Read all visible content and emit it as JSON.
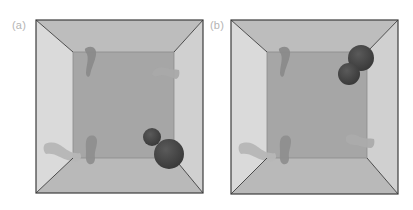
{
  "figure": {
    "panels": [
      {
        "id": "a",
        "label": "(a)",
        "label_pos": [
          12,
          19
        ],
        "outer": {
          "x1": 36,
          "y1": 20,
          "x2": 203,
          "y2": 193
        },
        "inner": {
          "x1": 73,
          "y1": 52,
          "x2": 174,
          "y2": 158
        },
        "spheres": [
          {
            "cx": 152,
            "cy": 137,
            "r": 9
          },
          {
            "cx": 169,
            "cy": 154,
            "r": 15
          }
        ],
        "worms": [
          {
            "name": "worm-top-left",
            "d": "M86,48 C92,45 97,48 96,55 C95,62 91,68 90,75 C89,78 86,77 86,73 C86,66 89,60 87,54 C85,51 84,49 86,48 Z",
            "fill": "#8a8a8a"
          },
          {
            "name": "worm-top-right",
            "d": "M152,74 C154,68 160,66 166,68 C171,70 175,69 179,70 C180,74 179,78 176,79 C171,78 166,75 161,75 C157,76 154,78 152,74 Z",
            "fill": "#a9a9a9"
          },
          {
            "name": "worm-left-wall",
            "d": "M45,144 C52,141 58,143 63,147 C68,151 74,154 80,153 C82,156 81,160 78,161 C72,162 66,160 60,157 C55,154 50,153 46,154 C43,151 43,146 45,144 Z",
            "fill": "#b6b6b6"
          },
          {
            "name": "worm-bottom-center",
            "d": "M88,137 C92,134 97,136 97,141 C97,147 94,152 95,158 C95,162 93,165 89,164 C85,162 86,156 86,151 C86,146 85,140 88,137 Z",
            "fill": "#8e8e8e"
          }
        ]
      },
      {
        "id": "b",
        "label": "(b)",
        "label_pos": [
          210,
          19
        ],
        "outer": {
          "x1": 231,
          "y1": 20,
          "x2": 398,
          "y2": 194
        },
        "inner": {
          "x1": 267,
          "y1": 52,
          "x2": 367,
          "y2": 158
        },
        "spheres": [
          {
            "cx": 361,
            "cy": 58,
            "r": 13
          },
          {
            "cx": 349,
            "cy": 74,
            "r": 11
          }
        ],
        "worms": [
          {
            "name": "worm-top-left",
            "d": "M280,48 C286,45 291,48 290,55 C289,62 285,68 284,75 C283,78 280,77 280,73 C280,66 283,60 281,54 C279,51 278,49 280,48 Z",
            "fill": "#8a8a8a"
          },
          {
            "name": "worm-bottom-right",
            "d": "M346,137 C349,133 355,134 360,137 C365,139 370,138 374,139 C375,143 374,147 371,148 C366,148 361,146 356,145 C351,145 348,144 346,141 Z",
            "fill": "#ababab"
          },
          {
            "name": "worm-left-wall",
            "d": "M240,144 C247,141 253,143 258,147 C263,151 269,154 275,153 C277,156 276,160 273,161 C267,162 261,160 255,157 C250,154 245,153 241,154 C238,151 238,146 240,144 Z",
            "fill": "#b6b6b6"
          },
          {
            "name": "worm-bottom-center",
            "d": "M282,137 C286,134 291,136 291,141 C291,147 288,152 289,158 C289,162 287,165 283,164 C279,162 280,156 280,151 C280,146 279,140 282,137 Z",
            "fill": "#8e8e8e"
          }
        ]
      }
    ],
    "colors": {
      "back_wall": "#a6a6a6",
      "top_wall": "#bdbdbd",
      "left_wall": "#dadada",
      "right_wall": "#d0d0d0",
      "bottom_wall": "#b9b9b9",
      "edge": "#3c3c3c",
      "inner_edge": "#8c8c8c",
      "sphere": "#3a3a3a",
      "sphere_highlight": "#5a5a5a"
    }
  }
}
